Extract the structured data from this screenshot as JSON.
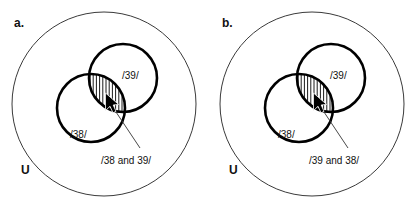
{
  "figure": {
    "width": 417,
    "height": 209,
    "background_color": "#ffffff",
    "type": "venn-diagram-pair"
  },
  "panels": [
    {
      "letter": "a.",
      "universe_label": "U",
      "sets": [
        {
          "label": "/39/",
          "position": "upper-right"
        },
        {
          "label": "/38/",
          "position": "lower-left"
        }
      ],
      "intersection": {
        "label": "/38 and 39/",
        "fill_style": "vertical-hatch",
        "cursor": "arrow-pointer"
      }
    },
    {
      "letter": "b.",
      "universe_label": "U",
      "sets": [
        {
          "label": "/39/",
          "position": "upper-right"
        },
        {
          "label": "/38/",
          "position": "lower-left"
        }
      ],
      "intersection": {
        "label": "/39 and 38/",
        "fill_style": "vertical-hatch",
        "cursor": "arrow-pointer"
      }
    }
  ],
  "colors": {
    "outer_stroke": "#3a3a3a",
    "set_stroke": "#000000",
    "hatch_stroke": "#000000",
    "text": "#111111",
    "cursor_fill": "#000000"
  }
}
